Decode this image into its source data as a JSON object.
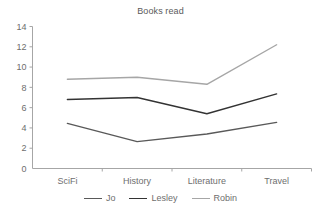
{
  "chart_data": {
    "type": "line",
    "title": "Books read",
    "xlabel": "",
    "ylabel": "",
    "categories": [
      "SciFi",
      "History",
      "Literature",
      "Travel"
    ],
    "series": [
      {
        "name": "Jo",
        "values": [
          4.45,
          2.65,
          3.4,
          4.55
        ],
        "color": "#595959"
      },
      {
        "name": "Lesley",
        "values": [
          6.8,
          7.0,
          5.4,
          7.35
        ],
        "color": "#333333"
      },
      {
        "name": "Robin",
        "values": [
          8.8,
          9.0,
          8.3,
          12.2
        ],
        "color": "#a6a6a6"
      }
    ],
    "ylim": [
      0,
      14
    ],
    "ytick_labels": [
      "0",
      "2",
      "4",
      "6",
      "8",
      "10",
      "12",
      "14"
    ],
    "ytick_values": [
      0,
      2,
      4,
      6,
      8,
      10,
      12,
      14
    ],
    "grid": false,
    "legend_position": "bottom",
    "axis_color": "#a6a6a6",
    "title_color": "#5a5a5a",
    "tick_label_color": "#6e6e6e"
  }
}
